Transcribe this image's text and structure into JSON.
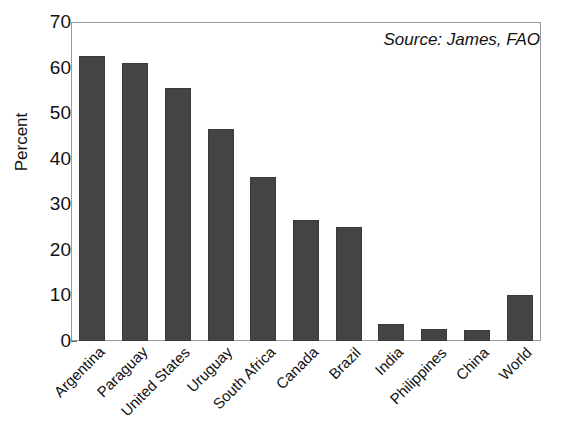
{
  "figure": {
    "title_remnant": "",
    "source_note": "Source: James, FAO"
  },
  "chart_data": {
    "type": "bar",
    "title": "",
    "subtitle": "",
    "xlabel": "",
    "ylabel": "Percent",
    "ylim": [
      0,
      70
    ],
    "yticks": [
      0,
      10,
      20,
      30,
      40,
      50,
      60,
      70
    ],
    "ytick_labels": [
      "0",
      "10",
      "20",
      "30",
      "40",
      "50",
      "60",
      "70"
    ],
    "grid": false,
    "legend": false,
    "annotations": [
      "Source: James, FAO"
    ],
    "bar_color": "#444444",
    "frame_color": "#9a9a9a",
    "categories": [
      "Argentina",
      "Paraguay",
      "United States",
      "Uruguay",
      "South Africa",
      "Canada",
      "Brazil",
      "India",
      "Philippines",
      "China",
      "World"
    ],
    "values": [
      62.5,
      61,
      55.5,
      46.5,
      36,
      26.5,
      25,
      3.7,
      2.6,
      2.4,
      10
    ]
  }
}
